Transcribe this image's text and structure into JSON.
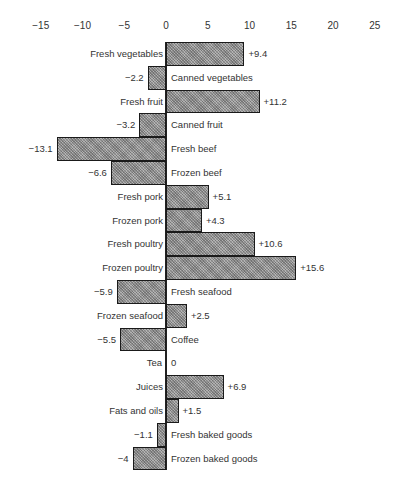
{
  "chart_data": {
    "type": "bar",
    "orientation": "horizontal",
    "title": "",
    "xlabel": "",
    "ylabel": "",
    "xlim": [
      -15,
      25
    ],
    "x_ticks": [
      -15,
      -10,
      -5,
      0,
      5,
      10,
      15,
      20,
      25
    ],
    "x_tick_labels": [
      "−15",
      "−10",
      "−5",
      "0",
      "5",
      "10",
      "15",
      "20",
      "25"
    ],
    "grid": false,
    "legend": null,
    "categories": [
      "Fresh vegetables",
      "Canned vegetables",
      "Fresh fruit",
      "Canned fruit",
      "Fresh beef",
      "Frozen beef",
      "Fresh pork",
      "Frozen pork",
      "Fresh poultry",
      "Frozen poultry",
      "Fresh seafood",
      "Frozen seafood",
      "Coffee",
      "Tea",
      "Juices",
      "Fats and oils",
      "Fresh baked goods",
      "Frozen baked goods"
    ],
    "values": [
      9.4,
      -2.2,
      11.2,
      -3.2,
      -13.1,
      -6.6,
      5.1,
      4.3,
      10.6,
      15.6,
      -5.9,
      2.5,
      -5.5,
      0,
      6.9,
      1.5,
      -1.1,
      -4
    ],
    "value_labels": [
      "+9.4",
      "−2.2",
      "+11.2",
      "−3.2",
      "−13.1",
      "−6.6",
      "+5.1",
      "+4.3",
      "+10.6",
      "+15.6",
      "−5.9",
      "+2.5",
      "−5.5",
      "0",
      "+6.9",
      "+1.5",
      "−1.1",
      "−4"
    ]
  },
  "colors": {
    "bar_fill": "#9a9a9a",
    "bar_border": "#1a1a1a",
    "text": "#333333",
    "background": "#ffffff"
  }
}
